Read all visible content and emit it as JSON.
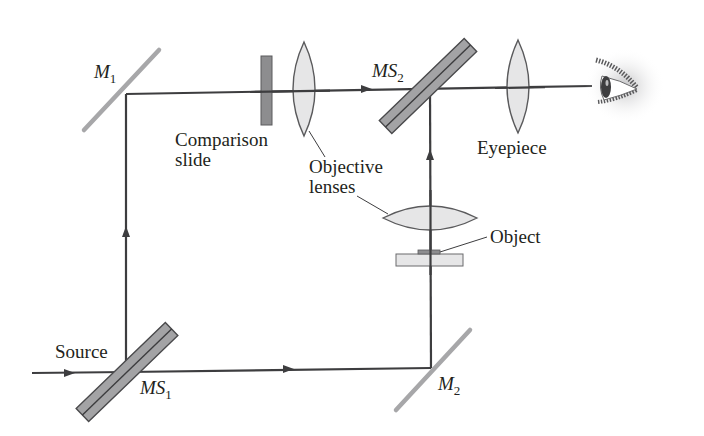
{
  "diagram": {
    "colors": {
      "beam": "#3d3d3f",
      "mirror": "#a7a7a9",
      "splitter_fill": "#a3a3a5",
      "splitter_edge": "#4a4a4c",
      "lens_fill": "#e6e6e7",
      "lens_edge": "#5a5a5c",
      "slide_fill": "#8d8d8f",
      "label": "#231f20"
    },
    "labels": {
      "m1": {
        "main": "M",
        "sub": "1"
      },
      "m2": {
        "main": "M",
        "sub": "2"
      },
      "ms1": {
        "main": "MS",
        "sub": "1"
      },
      "ms2": {
        "main": "MS",
        "sub": "2"
      },
      "comparison_slide_line1": "Comparison",
      "comparison_slide_line2": "slide",
      "objective_lenses_line1": "Objective",
      "objective_lenses_line2": "lenses",
      "eyepiece": "Eyepiece",
      "object": "Object",
      "source": "Source"
    },
    "components": [
      {
        "id": "source-beam",
        "type": "beam"
      },
      {
        "id": "MS1",
        "type": "beam-splitter"
      },
      {
        "id": "M1",
        "type": "mirror"
      },
      {
        "id": "M2",
        "type": "mirror"
      },
      {
        "id": "comparison-slide",
        "type": "slide"
      },
      {
        "id": "objective-lens-upper",
        "type": "lens"
      },
      {
        "id": "objective-lens-lower",
        "type": "lens"
      },
      {
        "id": "object-slide",
        "type": "slide"
      },
      {
        "id": "MS2",
        "type": "beam-splitter"
      },
      {
        "id": "eyepiece",
        "type": "lens"
      },
      {
        "id": "eye",
        "type": "observer"
      }
    ]
  }
}
